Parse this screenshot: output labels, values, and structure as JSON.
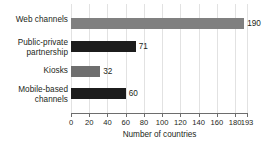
{
  "chart_data": {
    "type": "bar",
    "orientation": "horizontal",
    "title": "",
    "xlabel": "Number of countries",
    "ylabel": "",
    "categories": [
      "Web channels",
      "Public-private partnership",
      "Kiosks",
      "Mobile-based channels"
    ],
    "values": [
      190,
      71,
      32,
      60
    ],
    "value_labels": [
      "190",
      "71",
      "32",
      "60"
    ],
    "bar_colors": [
      "#808080",
      "#1c1c1c",
      "#6e6e6e",
      "#1c1c1c"
    ],
    "xlim": [
      0,
      193
    ],
    "xticks": [
      0,
      20,
      40,
      60,
      80,
      100,
      120,
      140,
      160,
      180,
      193
    ],
    "xtick_labels": [
      "0",
      "20",
      "40",
      "60",
      "80",
      "100",
      "120",
      "140",
      "160",
      "180",
      "193"
    ],
    "grid": "vertical",
    "legend": "none",
    "background": "#ffffff"
  },
  "categories": [
    {
      "label": "Web channels",
      "label_lines": "Web channels"
    },
    {
      "label": "Public-private partnership",
      "label_lines": "Public-private\npartnership"
    },
    {
      "label": "Kiosks",
      "label_lines": "Kiosks"
    },
    {
      "label": "Mobile-based channels",
      "label_lines": "Mobile-based\nchannels"
    }
  ]
}
